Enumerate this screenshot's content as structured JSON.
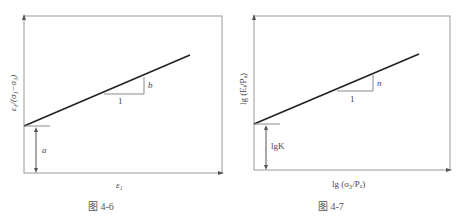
{
  "figures": [
    {
      "caption": "图 4-6",
      "xlabel": "ε₁",
      "ylabel": "ε₁/(σ₁−σ₃)",
      "slope_label": "b",
      "run_label": "1",
      "intercept_label": "a"
    },
    {
      "caption": "图 4-7",
      "xlabel": "lg (σ₃/Pₐ)",
      "ylabel": "lg (Eᵢ/Pₐ)",
      "slope_label": "n",
      "run_label": "1",
      "intercept_label": "lgK"
    }
  ],
  "colors": {
    "line": "#222222",
    "frame": "#9a9a9a",
    "guide": "#8a8a8a"
  }
}
